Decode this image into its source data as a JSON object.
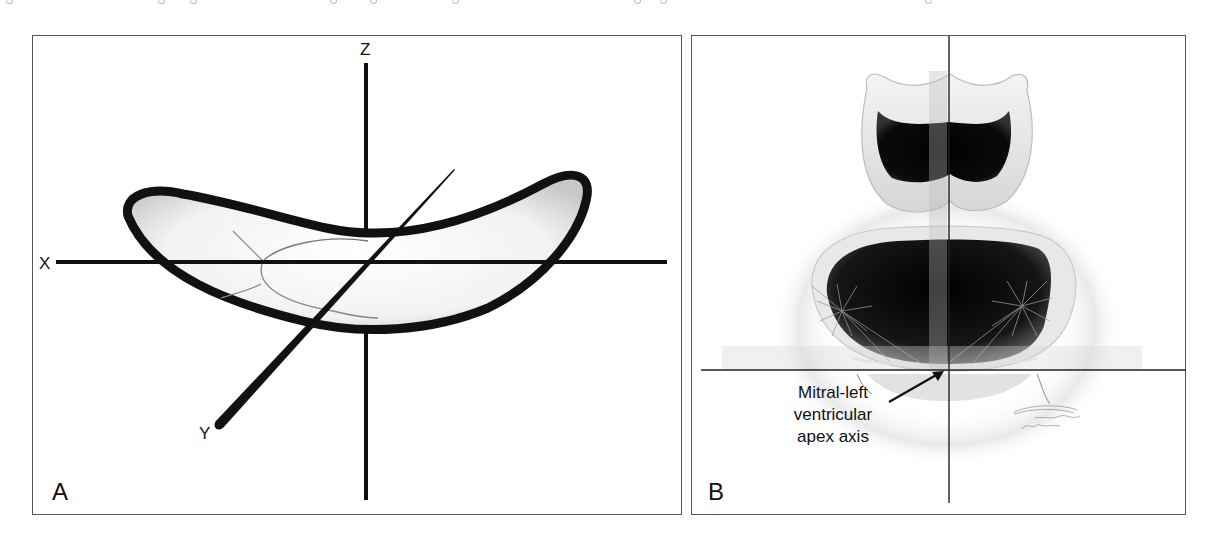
{
  "figure": {
    "panels": [
      {
        "id": "A",
        "label": "A",
        "description": "Saddle-shaped mitral annulus with three orthogonal axes",
        "axes": {
          "x_label": "X",
          "y_label": "Y",
          "z_label": "Z"
        }
      },
      {
        "id": "B",
        "label": "B",
        "description": "Aortic and mitral valves viewed with crosshair reference lines",
        "annotation": {
          "lines": [
            "Mitral-left",
            "ventricular",
            "apex axis"
          ]
        }
      }
    ],
    "colors": {
      "ink": "#111111",
      "border": "#555555",
      "background": "#ffffff",
      "shading": "#cfcfcf"
    }
  }
}
